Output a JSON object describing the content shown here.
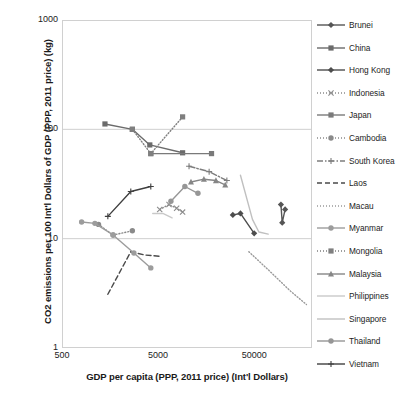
{
  "chart_data": {
    "type": "line",
    "title": "",
    "xlabel": "GDP per capita (PPP, 2011 price) (Int'l Dollars)",
    "ylabel": "CO2 emissions per 100 Int'l Dollars of GDP (PPP, 2011 price) (kg)",
    "xscale": "log",
    "yscale": "log",
    "xlim": [
      500,
      200000
    ],
    "ylim": [
      1,
      1000
    ],
    "xticks": [
      "500",
      "5000",
      "50000"
    ],
    "xtick_values": [
      500,
      5000,
      50000
    ],
    "yticks": [
      "1000",
      "100",
      "10",
      "1"
    ],
    "ytick_values": [
      1000,
      100,
      10,
      1
    ],
    "grid": "horizontal",
    "legend_position": "right",
    "series": [
      {
        "name": "Brunei",
        "color": "#555555",
        "dash": "solid",
        "marker": "diamond",
        "points": [
          [
            95000,
            20.5
          ],
          [
            98000,
            14.0
          ],
          [
            105000,
            18.5
          ]
        ]
      },
      {
        "name": "China",
        "color": "#6b6b6b",
        "dash": "solid",
        "marker": "square",
        "points": [
          [
            1400,
            112
          ],
          [
            2700,
            100
          ],
          [
            4100,
            72
          ],
          [
            9000,
            61
          ]
        ]
      },
      {
        "name": "Hong Kong",
        "color": "#4d4d4d",
        "dash": "solid",
        "marker": "diamond",
        "points": [
          [
            30000,
            16.5
          ],
          [
            36000,
            17.0
          ],
          [
            50000,
            11.2
          ]
        ]
      },
      {
        "name": "Indonesia",
        "color": "#8c8c8c",
        "dash": "dotted",
        "marker": "x",
        "points": [
          [
            5200,
            18.5
          ],
          [
            6500,
            20.5
          ],
          [
            7800,
            19.0
          ],
          [
            9000,
            17.5
          ]
        ]
      },
      {
        "name": "Japan",
        "color": "#7a7a7a",
        "dash": "solid",
        "marker": "square",
        "points": [
          [
            4200,
            60
          ],
          [
            18000,
            60
          ]
        ]
      },
      {
        "name": "Cambodia",
        "color": "#8a8a8a",
        "dash": "dotted",
        "marker": "circle",
        "points": [
          [
            1200,
            13.5
          ],
          [
            1700,
            10.8
          ],
          [
            2700,
            11.8
          ]
        ]
      },
      {
        "name": "South Korea",
        "color": "#7d7d7d",
        "dash": "dashdot",
        "marker": "plus",
        "points": [
          [
            10500,
            46
          ],
          [
            17000,
            41
          ],
          [
            26000,
            34
          ]
        ]
      },
      {
        "name": "Laos",
        "color": "#4a4a4a",
        "dash": "dashed",
        "marker": "none",
        "points": [
          [
            1500,
            3.1
          ],
          [
            2600,
            7.6
          ],
          [
            3600,
            7.1
          ],
          [
            5200,
            6.9
          ]
        ]
      },
      {
        "name": "Macau",
        "color": "#9a9a9a",
        "dash": "dotted",
        "marker": "none",
        "points": [
          [
            44000,
            7.6
          ],
          [
            70000,
            5.2
          ],
          [
            120000,
            3.3
          ],
          [
            175000,
            2.5
          ]
        ]
      },
      {
        "name": "Myanmar",
        "color": "#9c9c9c",
        "dash": "solid",
        "marker": "circle",
        "points": [
          [
            800,
            14.2
          ],
          [
            1100,
            13.8
          ],
          [
            1700,
            10.8
          ],
          [
            2800,
            7.4
          ],
          [
            4200,
            5.4
          ]
        ]
      },
      {
        "name": "Mongolia",
        "color": "#7f7f7f",
        "dash": "dotted",
        "marker": "square",
        "points": [
          [
            2700,
            100
          ],
          [
            4200,
            60
          ],
          [
            9000,
            130
          ]
        ]
      },
      {
        "name": "Malaysia",
        "color": "#868686",
        "dash": "solid",
        "marker": "triangle",
        "points": [
          [
            11000,
            33
          ],
          [
            15000,
            35
          ],
          [
            20000,
            34
          ],
          [
            25000,
            31
          ]
        ]
      },
      {
        "name": "Philippines",
        "color": "#c9c9c9",
        "dash": "solid",
        "marker": "none",
        "points": [
          [
            4400,
            17.0
          ],
          [
            5600,
            17.0
          ],
          [
            7000,
            15.5
          ]
        ]
      },
      {
        "name": "Singapore",
        "color": "#c0c0c0",
        "dash": "solid",
        "marker": "none",
        "points": [
          [
            36000,
            38
          ],
          [
            48000,
            15
          ],
          [
            56000,
            11.5
          ],
          [
            70000,
            11.0
          ]
        ]
      },
      {
        "name": "Thailand",
        "color": "#969696",
        "dash": "solid",
        "marker": "circle",
        "points": [
          [
            6800,
            22
          ],
          [
            9500,
            30
          ],
          [
            13000,
            26
          ]
        ]
      },
      {
        "name": "Vietnam",
        "color": "#3f3f3f",
        "dash": "solid",
        "marker": "plus",
        "points": [
          [
            1500,
            16.0
          ],
          [
            2600,
            27.0
          ],
          [
            4200,
            30.0
          ]
        ]
      }
    ]
  },
  "legend": {
    "items": [
      {
        "label": "Brunei"
      },
      {
        "label": "China"
      },
      {
        "label": "Hong Kong"
      },
      {
        "label": "Indonesia"
      },
      {
        "label": "Japan"
      },
      {
        "label": "Cambodia"
      },
      {
        "label": "South Korea"
      },
      {
        "label": "Laos"
      },
      {
        "label": "Macau"
      },
      {
        "label": "Myanmar"
      },
      {
        "label": "Mongolia"
      },
      {
        "label": "Malaysia"
      },
      {
        "label": "Philippines"
      },
      {
        "label": "Singapore"
      },
      {
        "label": "Thailand"
      },
      {
        "label": "Vietnam"
      }
    ]
  }
}
